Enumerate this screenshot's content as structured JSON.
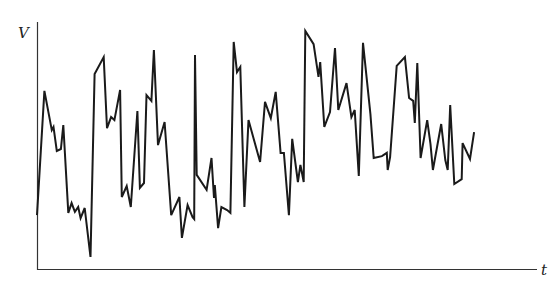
{
  "chart_data": {
    "type": "line",
    "title": "",
    "xlabel": "t",
    "ylabel": "V",
    "xlim": [
      0,
      100
    ],
    "ylim": [
      0,
      100
    ],
    "grid": false,
    "legend": null,
    "ticks": "none",
    "line_color": "#1a1a1a",
    "series": [
      {
        "name": "V(t)",
        "t": [
          0,
          1.8,
          3.6,
          4,
          4.8,
          5.8,
          6.4,
          7.6,
          8.4,
          9.2,
          10,
          10.6,
          11.6,
          13,
          14,
          16.2,
          17,
          18,
          18.8,
          20.2,
          20.6,
          21.8,
          22.8,
          24.4,
          25,
          26,
          26.6,
          27.8,
          28.4,
          29.4,
          31,
          32.6,
          34.6,
          35.2,
          36.6,
          37.8,
          38.2,
          38.4,
          38.8,
          41.2,
          42.4,
          43,
          43.2,
          44,
          44.8,
          46.2,
          47,
          47.8,
          48.6,
          49.4,
          50.4,
          51.4,
          54.2,
          55.4,
          56.8,
          58,
          59.2,
          60,
          61.2,
          62,
          63.4,
          64,
          64.8,
          65.2,
          67.2,
          68.4,
          68.8,
          69.8,
          71.2,
          72.4,
          73.2,
          75.2,
          76.4,
          77.2,
          78.2,
          79.2,
          81,
          81.8,
          83.8,
          85,
          85.2,
          85.8,
          87.4,
          89.4,
          90.4,
          91.4,
          91.8,
          92.4,
          93.2,
          94.8,
          95.6,
          96.2,
          98.2,
          99.2,
          99.8,
          100.4,
          101.4,
          103.2,
          103.4,
          105.2,
          106.2,
          107.2,
          108.2,
          109.2,
          110.6,
          111.2,
          111.8,
          112.6,
          114.2,
          115.6,
          116.2,
          117.6
        ],
        "V": [
          22.4,
          73.1,
          57.1,
          58.4,
          48.6,
          49.4,
          59.2,
          23.3,
          27.3,
          23.7,
          25.7,
          21.2,
          25.3,
          5.3,
          80,
          86.9,
          57.9,
          62.4,
          61.2,
          73.5,
          29.8,
          34.3,
          25.7,
          64.9,
          33.5,
          35.5,
          71.4,
          69,
          89.8,
          51,
          60.4,
          22.4,
          29.8,
          13.1,
          26.5,
          21.6,
          20.8,
          87.8,
          38.8,
          32.7,
          45.7,
          29.4,
          34.7,
          17.1,
          25.7,
          24.5,
          23.3,
          93.1,
          80.8,
          82.9,
          25.7,
          61.2,
          44.1,
          68.6,
          62,
          72.7,
          47.8,
          47.8,
          22.4,
          53.5,
          35.9,
          42.9,
          35.9,
          97.6,
          92.2,
          78.8,
          84.9,
          58.4,
          64.5,
          90.6,
          65.3,
          76.3,
          62.4,
          65.3,
          38.4,
          92.7,
          63.7,
          45.7,
          46.5,
          47.8,
          40.8,
          46.1,
          83.3,
          86.9,
          70.2,
          69,
          60,
          84.5,
          45.7,
          61.2,
          51.4,
          40.8,
          59.6,
          44.9,
          40.8,
          67.3,
          35.1,
          37.1,
          51.8,
          45.3,
          56.3
        ],
        "note": "t normalized so axis spans 0-100 across plot width; V normalized 0 (t-axis) to 100 (top of V-axis)"
      }
    ]
  },
  "labels": {
    "y_axis": "V",
    "x_axis": "t"
  }
}
